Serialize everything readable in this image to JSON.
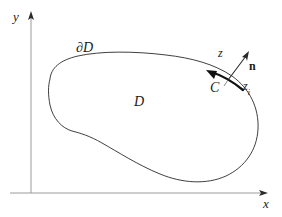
{
  "figure": {
    "background_color": "#ffffff",
    "stroke_color": "#1a1a1a",
    "width": 282,
    "height": 217
  },
  "axes": {
    "x_label": "x",
    "y_label": "y",
    "x_axis_y": 193,
    "y_axis_x": 31,
    "x_label_pos": {
      "x": 263,
      "y": 199
    },
    "y_label_pos": {
      "x": 13,
      "y": 11
    },
    "x_arrow_tip": {
      "x": 268,
      "y": 193
    },
    "y_arrow_tip": {
      "x": 31,
      "y": 12
    }
  },
  "labels": {
    "boundary": "∂",
    "boundary_script": "D",
    "boundary_pos": {
      "x": 76,
      "y": 42
    },
    "domain_script": "D",
    "domain_pos": {
      "x": 134,
      "y": 96
    },
    "z_point": "z",
    "z_pos": {
      "x": 219,
      "y": 48
    },
    "normal": "n",
    "normal_pos": {
      "x": 249,
      "y": 61
    },
    "contour_script": "C",
    "contour_pos": {
      "x": 211,
      "y": 82
    },
    "z_i_base": "z",
    "z_i_sub": "i",
    "z_i_pos": {
      "x": 243,
      "y": 81
    }
  },
  "geometry": {
    "boundary_path": "M 50 78 C 52 66, 66 58, 88 54 C 116 49, 152 51, 182 58 C 206 64, 228 76, 241 94 C 254 112, 256 136, 246 155 C 236 174, 214 182, 190 179 C 166 176, 142 162, 122 148 C 104 135, 88 126, 74 124 C 62 122, 54 114, 51 100 C 49 90, 49 84, 50 78 Z",
    "arc_path": "M 209 72 C 218 76, 230 81, 240 88",
    "arc_arrow_tip": {
      "x": 207,
      "y": 71
    },
    "normal_vector": {
      "x1": 228,
      "y1": 80,
      "x2": 248,
      "y2": 53
    }
  }
}
